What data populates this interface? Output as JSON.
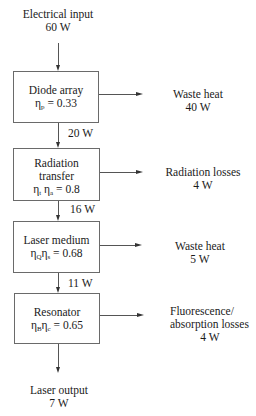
{
  "input": {
    "label": "Electrical input",
    "value": "60 W"
  },
  "stages": [
    {
      "title": "Diode array",
      "title2": "",
      "eta": "η",
      "sub1": "p",
      "eta2": "",
      "sub2": "",
      "value": " = 0.33",
      "loss": {
        "label": "Waste heat",
        "label2": "",
        "value": "40 W"
      },
      "output_flow": "20 W"
    },
    {
      "title": "Radiation",
      "title2": "transfer",
      "eta": "η",
      "sub1": "t",
      "eta2": "η",
      "sub2": "a",
      "value": " = 0.8",
      "loss": {
        "label": "Radiation losses",
        "label2": "",
        "value": "4 W"
      },
      "output_flow": "16 W"
    },
    {
      "title": "Laser medium",
      "title2": "",
      "eta": "η",
      "sub1": "Q",
      "eta2": "η",
      "sub2": "s",
      "value": " = 0.68",
      "loss": {
        "label": "Waste heat",
        "label2": "",
        "value": "5 W"
      },
      "output_flow": "11 W"
    },
    {
      "title": "Resonator",
      "title2": "",
      "eta": "η",
      "sub1": "B",
      "eta2": "η",
      "sub2": "c",
      "value": " = 0.65",
      "loss": {
        "label": "Fluorescence/",
        "label2": "absorption losses",
        "value": "4 W"
      },
      "output_flow": ""
    }
  ],
  "output": {
    "label": "Laser output",
    "value": "7 W"
  }
}
